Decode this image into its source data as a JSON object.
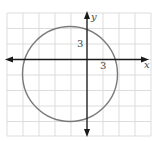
{
  "diagram": {
    "type": "coordinate-plane-circle",
    "axes": {
      "x_label": "x",
      "y_label": "y",
      "x_tick_label": "3",
      "y_tick_label": "3",
      "units_per_grid": 3
    },
    "grid": {
      "columns": 9,
      "rows": 8,
      "x_range_grids": [
        -5,
        4
      ],
      "y_range_grids": [
        -5,
        3
      ]
    },
    "circle": {
      "center": [
        -3,
        -3
      ],
      "radius": 9,
      "equation": "(x+3)^2 + (y+3)^2 = 81"
    },
    "colors": {
      "grid": "#d4d4d4",
      "axes": "#1a1a1a",
      "circle": "#7a7a7a",
      "labels": "#444444"
    }
  }
}
